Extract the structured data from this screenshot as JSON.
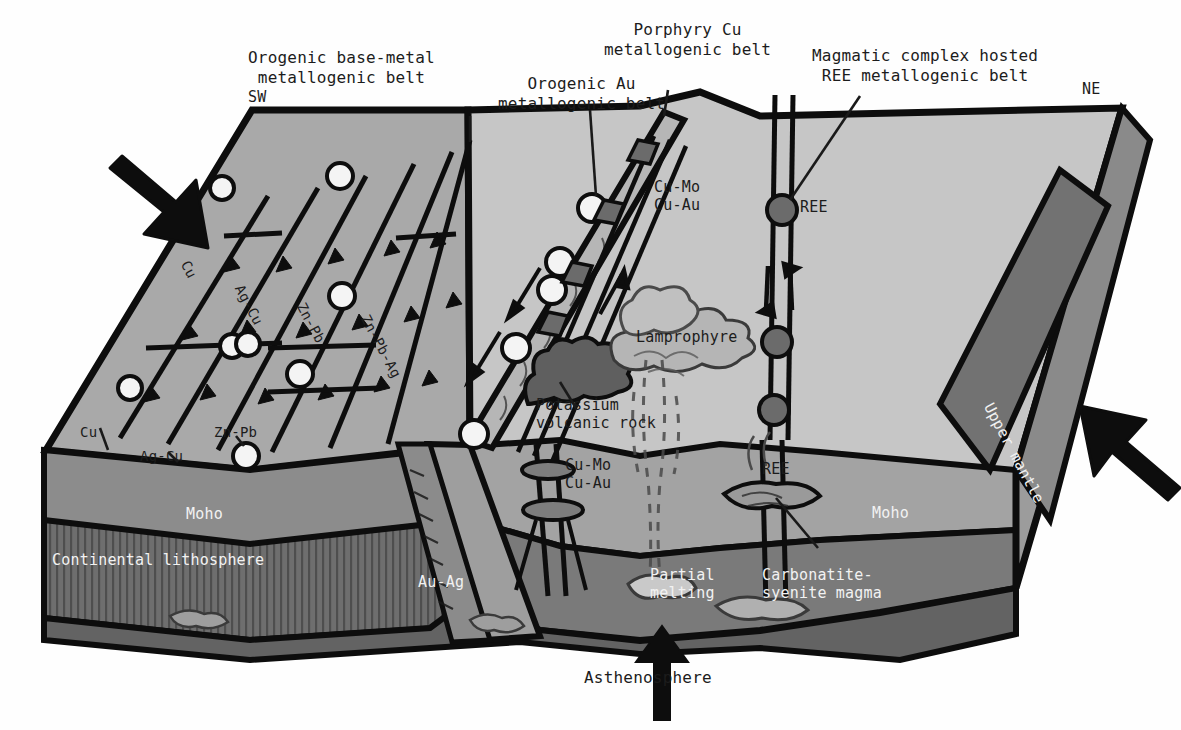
{
  "figure": {
    "type": "geological-block-diagram",
    "orientation_left": "SW",
    "orientation_right": "NE"
  },
  "callouts": [
    {
      "name": "orogenic-base-metal",
      "text": "Orogenic base-metal\nmetallogenic belt",
      "x": 248,
      "y": 48
    },
    {
      "name": "orogenic-au",
      "text": "Orogenic Au\nmetallogenic belt",
      "x": 498,
      "y": 74
    },
    {
      "name": "porphyry-cu",
      "text": "Porphyry Cu\nmetallogenic belt",
      "x": 604,
      "y": 20
    },
    {
      "name": "magmatic-ree",
      "text": "Magmatic complex hosted\nREE metallogenic belt",
      "x": 812,
      "y": 46
    }
  ],
  "compass": {
    "sw": "SW",
    "ne": "NE",
    "sw_x": 248,
    "sw_y": 88,
    "ne_x": 1082,
    "ne_y": 80
  },
  "surface_labels": [
    {
      "name": "fault-label-cu",
      "text": "Cu",
      "x": 192,
      "y": 258,
      "rot": 62
    },
    {
      "name": "fault-label-ag-cu",
      "text": "Ag-Cu",
      "x": 246,
      "y": 282,
      "rot": 62
    },
    {
      "name": "fault-label-zn-pb",
      "text": "Zn-Pb",
      "x": 308,
      "y": 300,
      "rot": 62
    },
    {
      "name": "fault-label-zn-pb-ag",
      "text": "Zn-Pb-Ag",
      "x": 372,
      "y": 312,
      "rot": 62
    },
    {
      "name": "edge-label-cu",
      "text": "Cu",
      "x": 80,
      "y": 424,
      "rot": 0
    },
    {
      "name": "edge-label-ag-cu",
      "text": "Ag-Cu",
      "x": 140,
      "y": 448,
      "rot": 0
    },
    {
      "name": "edge-label-zn-pb",
      "text": "Zn-Pb",
      "x": 214,
      "y": 424,
      "rot": 0
    }
  ],
  "ore_labels": [
    {
      "name": "cu-mo-cu-au-upper",
      "text": "Cu-Mo\nCu-Au",
      "x": 654,
      "y": 178
    },
    {
      "name": "ree-upper",
      "text": "REE",
      "x": 800,
      "y": 198
    },
    {
      "name": "lamprophyre",
      "text": "Lamprophyre",
      "x": 636,
      "y": 328
    },
    {
      "name": "potassium-rock",
      "text": "Potassium\nvolcanic rock",
      "x": 536,
      "y": 396
    },
    {
      "name": "cu-mo-cu-au-lower",
      "text": "Cu-Mo\nCu-Au",
      "x": 565,
      "y": 456
    },
    {
      "name": "ree-lower",
      "text": "REE",
      "x": 762,
      "y": 460
    }
  ],
  "interior_labels": [
    {
      "name": "moho-left",
      "text": "Moho",
      "x": 186,
      "y": 505,
      "white": true
    },
    {
      "name": "moho-right",
      "text": "Moho",
      "x": 872,
      "y": 504,
      "white": true
    },
    {
      "name": "continental-lithosphere",
      "text": "Continental lithosphere",
      "x": 52,
      "y": 551,
      "white": true
    },
    {
      "name": "au-ag",
      "text": "Au-Ag",
      "x": 418,
      "y": 573,
      "white": true
    },
    {
      "name": "partial-melting",
      "text": "Partial\nmelting",
      "x": 650,
      "y": 566,
      "white": true
    },
    {
      "name": "carbonatite-magma",
      "text": "Carbonatite-\nsyenite magma",
      "x": 762,
      "y": 566,
      "white": true
    },
    {
      "name": "upper-mantle",
      "text": "Upper mantle",
      "x": 996,
      "y": 400,
      "white": true,
      "rot": 62
    }
  ],
  "bottom_label": {
    "name": "asthenosphere",
    "text": "Asthenosphere",
    "x": 584,
    "y": 668
  },
  "colors": {
    "top_left_surface": "#a9a9a9",
    "top_right_surface": "#c6c6c6",
    "crust_band": "#8c8c8c",
    "lithosphere_band": "#6e6e6e",
    "asthenosphere": "#636363",
    "upper_mantle_face": "#727272",
    "side_face_dark": "#8a8a8a",
    "outline": "#0d0d0d",
    "ore_white": "#f4f4f4",
    "ore_dark": "#6b6b6b",
    "volcanic_dark": "#5f5f5f",
    "lamprophyre_fill": "#b5b5b5"
  },
  "arrows": {
    "convergence_left": {
      "name": "convergence-arrow-sw",
      "direction": "down-right"
    },
    "convergence_right": {
      "name": "convergence-arrow-ne",
      "direction": "up-left"
    },
    "asthenosphere_upwelling": {
      "name": "upwelling-arrow",
      "direction": "up"
    }
  }
}
